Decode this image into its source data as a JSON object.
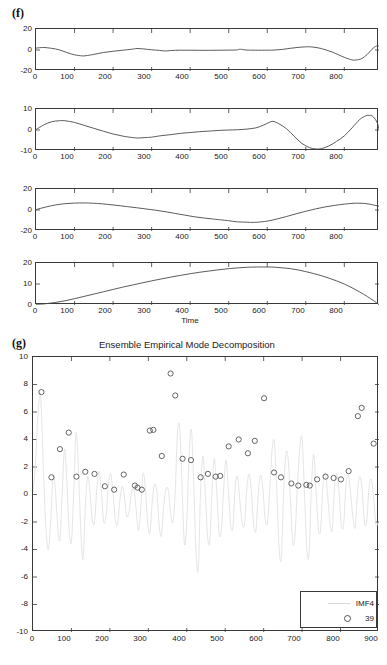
{
  "figure": {
    "panel_f_label": "(f)",
    "panel_g_label": "(g)"
  },
  "chart_data": [
    {
      "id": "imf-residual-1",
      "type": "line",
      "title": "",
      "xlabel": "",
      "ylabel": "",
      "xlim": [
        0,
        890
      ],
      "ylim": [
        -20,
        20
      ],
      "yticks": [
        -20,
        0,
        20
      ],
      "ytick_labels": [
        "-20",
        "0",
        "20"
      ],
      "xticks": [
        0,
        100,
        200,
        300,
        400,
        500,
        600,
        700,
        800
      ],
      "xtick_labels": [
        "0",
        "100",
        "200",
        "300",
        "400",
        "500",
        "600",
        "700",
        "800"
      ],
      "grid": false,
      "legend": "none",
      "series": [
        {
          "name": "IMF5",
          "x": [
            0,
            20,
            40,
            60,
            80,
            100,
            120,
            130,
            150,
            175,
            200,
            225,
            250,
            262,
            280,
            300,
            320,
            335,
            350,
            375,
            400,
            425,
            450,
            475,
            500,
            520,
            530,
            545,
            570,
            600,
            620,
            640,
            660,
            680,
            700,
            715,
            740,
            770,
            800,
            820,
            830,
            845,
            860,
            875,
            885,
            890
          ],
          "values": [
            1.8,
            2.4,
            1.6,
            0.2,
            -2.4,
            -4.6,
            -5.6,
            -5.4,
            -4.2,
            -2.4,
            -1.2,
            -0.2,
            0.8,
            1.4,
            1.0,
            0.2,
            -0.4,
            -0.9,
            -0.5,
            -0.2,
            -0.2,
            -0.3,
            -0.3,
            -0.2,
            -0.1,
            0.0,
            0.7,
            0.0,
            -0.2,
            -0.2,
            0.0,
            0.6,
            1.6,
            2.5,
            3.0,
            2.9,
            1.4,
            -2.2,
            -7.0,
            -9.4,
            -9.5,
            -8.2,
            -4.0,
            1.8,
            4.0,
            3.4
          ]
        }
      ]
    },
    {
      "id": "imf-residual-2",
      "type": "line",
      "title": "",
      "xlabel": "",
      "ylabel": "",
      "xlim": [
        0,
        890
      ],
      "ylim": [
        -10,
        10
      ],
      "yticks": [
        -10,
        0,
        10
      ],
      "ytick_labels": [
        "-10",
        "0",
        "10"
      ],
      "xticks": [
        0,
        100,
        200,
        300,
        400,
        500,
        600,
        700,
        800
      ],
      "xtick_labels": [
        "0",
        "100",
        "200",
        "300",
        "400",
        "500",
        "600",
        "700",
        "800"
      ],
      "grid": false,
      "legend": "none",
      "series": [
        {
          "name": "IMF6",
          "x": [
            0,
            20,
            40,
            60,
            75,
            100,
            125,
            150,
            175,
            200,
            225,
            250,
            265,
            285,
            300,
            325,
            350,
            375,
            400,
            425,
            450,
            475,
            500,
            520,
            545,
            570,
            590,
            605,
            615,
            630,
            650,
            670,
            690,
            710,
            725,
            740,
            760,
            780,
            800,
            820,
            840,
            855,
            865,
            875,
            885,
            890
          ],
          "values": [
            0.2,
            2.4,
            3.9,
            4.4,
            4.4,
            3.6,
            2.2,
            0.8,
            -0.6,
            -1.9,
            -2.9,
            -3.6,
            -3.8,
            -3.6,
            -3.4,
            -2.7,
            -2.2,
            -1.6,
            -1.2,
            -0.8,
            -0.5,
            -0.2,
            0.0,
            0.1,
            0.4,
            1.0,
            2.3,
            3.6,
            4.1,
            3.0,
            0.6,
            -3.0,
            -6.4,
            -8.4,
            -9.0,
            -8.9,
            -7.6,
            -5.4,
            -2.8,
            1.0,
            5.0,
            6.7,
            7.0,
            6.3,
            3.6,
            0.4
          ]
        }
      ]
    },
    {
      "id": "imf-residual-3",
      "type": "line",
      "title": "",
      "xlabel": "",
      "ylabel": "",
      "xlim": [
        0,
        890
      ],
      "ylim": [
        -20,
        20
      ],
      "yticks": [
        -20,
        0,
        20
      ],
      "ytick_labels": [
        "-20",
        "0",
        "20"
      ],
      "xticks": [
        0,
        100,
        200,
        300,
        400,
        500,
        600,
        700,
        800
      ],
      "xtick_labels": [
        "0",
        "100",
        "200",
        "300",
        "400",
        "500",
        "600",
        "700",
        "800"
      ],
      "grid": false,
      "legend": "none",
      "series": [
        {
          "name": "IMF7",
          "x": [
            0,
            25,
            50,
            75,
            100,
            125,
            140,
            160,
            185,
            210,
            235,
            260,
            285,
            310,
            335,
            360,
            385,
            410,
            435,
            460,
            485,
            500,
            520,
            545,
            560,
            575,
            600,
            625,
            650,
            675,
            700,
            725,
            750,
            775,
            800,
            820,
            835,
            850,
            865,
            880,
            890
          ],
          "values": [
            0.4,
            2.8,
            4.8,
            6.0,
            6.6,
            6.7,
            6.6,
            6.2,
            5.4,
            4.4,
            3.3,
            2.2,
            1.0,
            -0.2,
            -1.6,
            -3.2,
            -4.8,
            -6.4,
            -7.6,
            -8.6,
            -9.6,
            -10.2,
            -11.2,
            -11.6,
            -11.8,
            -11.6,
            -10.6,
            -8.6,
            -6.2,
            -3.6,
            -1.2,
            1.0,
            2.9,
            4.4,
            5.6,
            6.3,
            6.5,
            6.3,
            5.6,
            4.4,
            3.6
          ]
        }
      ]
    },
    {
      "id": "imf-residual-4",
      "type": "line",
      "title": "",
      "xlabel": "Time",
      "ylabel": "",
      "xlim": [
        0,
        890
      ],
      "ylim": [
        0,
        20
      ],
      "yticks": [
        0,
        10,
        20
      ],
      "ytick_labels": [
        "0",
        "10",
        "20"
      ],
      "xticks": [
        0,
        100,
        200,
        300,
        400,
        500,
        600,
        700,
        800
      ],
      "xtick_labels": [
        "0",
        "100",
        "200",
        "300",
        "400",
        "500",
        "600",
        "700",
        "800"
      ],
      "grid": false,
      "legend": "none",
      "series": [
        {
          "name": "Residual",
          "x": [
            0,
            25,
            50,
            75,
            100,
            125,
            150,
            175,
            200,
            225,
            250,
            275,
            300,
            325,
            350,
            375,
            400,
            425,
            450,
            475,
            500,
            525,
            550,
            575,
            600,
            620,
            640,
            660,
            680,
            700,
            720,
            740,
            760,
            780,
            800,
            820,
            840,
            860,
            875,
            890
          ],
          "values": [
            0.3,
            0.6,
            1.2,
            2.0,
            3.0,
            4.1,
            5.2,
            6.3,
            7.4,
            8.5,
            9.5,
            10.5,
            11.5,
            12.4,
            13.3,
            14.1,
            14.9,
            15.6,
            16.2,
            16.8,
            17.3,
            17.7,
            18.0,
            18.1,
            18.1,
            18.0,
            17.7,
            17.3,
            16.7,
            15.9,
            15.0,
            14.0,
            12.8,
            11.5,
            10.0,
            8.2,
            6.2,
            4.0,
            2.2,
            0.2
          ]
        }
      ]
    },
    {
      "id": "eemd-imf4",
      "type": "scatter",
      "title": "Ensemble Empirical Mode Decomposition",
      "xlabel": "",
      "ylabel": "",
      "xlim": [
        0,
        900
      ],
      "ylim": [
        -10,
        10
      ],
      "yticks": [
        -10,
        -8,
        -6,
        -4,
        -2,
        0,
        2,
        4,
        6,
        8,
        10
      ],
      "ytick_labels": [
        "-10",
        "-8",
        "-6",
        "-4",
        "-2",
        "0",
        "2",
        "4",
        "6",
        "8",
        "10"
      ],
      "xticks": [
        0,
        100,
        200,
        300,
        400,
        500,
        600,
        700,
        800,
        900
      ],
      "xtick_labels": [
        "0",
        "100",
        "200",
        "300",
        "400",
        "500",
        "600",
        "700",
        "800",
        "900"
      ],
      "grid": false,
      "legend": "inside-bottom-right",
      "legend_entries": [
        {
          "label": "IMF4",
          "glyph": "line"
        },
        {
          "label": "39",
          "glyph": "circle"
        }
      ],
      "series": [
        {
          "name": "IMF4",
          "glyph": "line",
          "color": "#e0e0e0",
          "x": [
            0,
            6,
            12,
            18,
            22,
            28,
            34,
            40,
            46,
            52,
            58,
            64,
            70,
            76,
            82,
            88,
            94,
            100,
            106,
            112,
            118,
            124,
            130,
            136,
            142,
            148,
            154,
            160,
            166,
            172,
            178,
            184,
            190,
            196,
            202,
            208,
            214,
            220,
            226,
            232,
            238,
            244,
            250,
            256,
            262,
            268,
            274,
            280,
            286,
            292,
            298,
            304,
            310,
            316,
            322,
            328,
            334,
            340,
            346,
            352,
            358,
            364,
            370,
            376,
            382,
            388,
            394,
            400,
            406,
            412,
            418,
            424,
            430,
            436,
            442,
            448,
            454,
            460,
            466,
            472,
            478,
            484,
            490,
            496,
            502,
            508,
            514,
            520,
            526,
            532,
            538,
            544,
            550,
            556,
            562,
            568,
            574,
            580,
            586,
            592,
            598,
            604,
            610,
            616,
            622,
            628,
            634,
            640,
            646,
            652,
            658,
            664,
            670,
            676,
            682,
            688,
            694,
            700,
            706,
            712,
            718,
            724,
            730,
            736,
            742,
            748,
            754,
            760,
            766,
            772,
            778,
            784,
            790,
            796,
            802,
            808,
            814,
            820,
            826,
            832,
            838,
            844,
            850,
            856,
            862,
            868,
            874,
            880,
            886,
            892,
            898
          ],
          "values": [
            0.2,
            2.0,
            5.4,
            7.4,
            6.0,
            1.0,
            -2.6,
            -4.0,
            -2.0,
            1.3,
            0.4,
            -2.2,
            -3.3,
            0.1,
            3.3,
            1.0,
            -2.6,
            -3.4,
            0.2,
            4.5,
            2.0,
            -2.4,
            -4.7,
            -1.0,
            1.3,
            0.2,
            -1.8,
            -2.0,
            0.4,
            1.7,
            0.1,
            -2.0,
            -1.6,
            0.6,
            1.5,
            0.2,
            -1.8,
            -2.2,
            -0.4,
            0.6,
            -0.2,
            -1.6,
            -1.2,
            0.1,
            0.4,
            -1.0,
            -2.6,
            -1.2,
            1.5,
            0.6,
            -2.0,
            -2.8,
            -0.6,
            0.7,
            0.3,
            -2.2,
            -3.0,
            -0.8,
            0.4,
            0.3,
            -1.4,
            -2.0,
            0.2,
            4.6,
            4.7,
            0.2,
            -3.6,
            -2.0,
            2.8,
            4.7,
            0.8,
            -4.2,
            -5.4,
            0.4,
            2.8,
            0.2,
            -3.0,
            -3.4,
            0.6,
            2.6,
            0.2,
            -2.8,
            -2.6,
            0.4,
            2.5,
            0.4,
            -2.2,
            -2.4,
            0.6,
            1.3,
            -0.4,
            -2.0,
            -2.2,
            0.3,
            1.5,
            0.2,
            -2.2,
            -2.6,
            0.1,
            1.4,
            0.4,
            -1.8,
            -2.0,
            0.4,
            3.3,
            3.8,
            0.4,
            -3.8,
            -4.6,
            0.2,
            3.0,
            2.5,
            -0.6,
            -3.6,
            -2.8,
            0.8,
            3.4,
            4.1,
            0.2,
            -3.8,
            -4.4,
            0.4,
            2.9,
            0.4,
            -2.4,
            -2.6,
            0.6,
            1.6,
            0.1,
            -2.0,
            -2.6,
            0.4,
            1.5,
            0.2,
            -2.2,
            -2.2,
            0.6,
            1.4,
            0.1,
            -1.6,
            -2.4,
            0.2,
            1.3,
            0.4,
            -2.0,
            -2.0,
            0.5,
            1.1,
            -0.2,
            -2.2,
            -2.0,
            0.4,
            1.0,
            0.2,
            -1.8,
            -2.0
          ]
        },
        {
          "name": "39",
          "glyph": "circle",
          "color": "#555555",
          "x": [
            22,
            48,
            70,
            93,
            113,
            136,
            160,
            187,
            211,
            236,
            265,
            272,
            283,
            304,
            313,
            335,
            358,
            370,
            389,
            411,
            436,
            455,
            475,
            487,
            509,
            535,
            559,
            577,
            601,
            627,
            645,
            672,
            690,
            711,
            720,
            739,
            761,
            782,
            801,
            821,
            845,
            855,
            886
          ],
          "values": [
            7.45,
            1.25,
            3.3,
            4.5,
            1.3,
            1.65,
            1.5,
            0.6,
            0.35,
            1.45,
            0.65,
            0.5,
            0.35,
            4.65,
            4.7,
            2.8,
            8.8,
            7.2,
            2.6,
            2.5,
            1.25,
            1.5,
            1.3,
            1.35,
            3.5,
            4.0,
            3.0,
            3.9,
            7.0,
            1.6,
            1.25,
            0.8,
            0.65,
            0.7,
            0.65,
            1.1,
            1.3,
            1.2,
            1.1,
            1.7,
            5.7,
            6.3,
            3.7
          ]
        }
      ]
    }
  ]
}
